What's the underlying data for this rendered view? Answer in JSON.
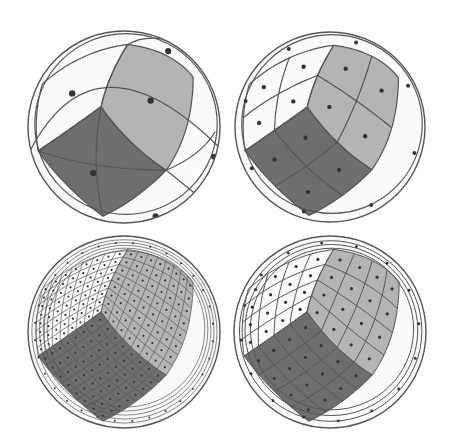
{
  "figure": {
    "colors": {
      "background": "#ffffff",
      "outline": "#555555",
      "light_face": "#b4b4b4",
      "dark_face": "#6e6e6e",
      "dot": "#333333",
      "white_face": "#fafafa"
    },
    "panels": [
      {
        "id": "n1",
        "label": "top-left",
        "grid_divisions": 1,
        "cx": 124,
        "cy": 127,
        "r": 96
      },
      {
        "id": "n2",
        "label": "top-right",
        "grid_divisions": 2,
        "cx": 330,
        "cy": 127,
        "r": 95
      },
      {
        "id": "n8",
        "label": "bottom-left",
        "grid_divisions": 8,
        "cx": 124,
        "cy": 332,
        "r": 96
      },
      {
        "id": "n4",
        "label": "bottom-right",
        "grid_divisions": 4,
        "cx": 330,
        "cy": 332,
        "r": 96
      }
    ]
  }
}
